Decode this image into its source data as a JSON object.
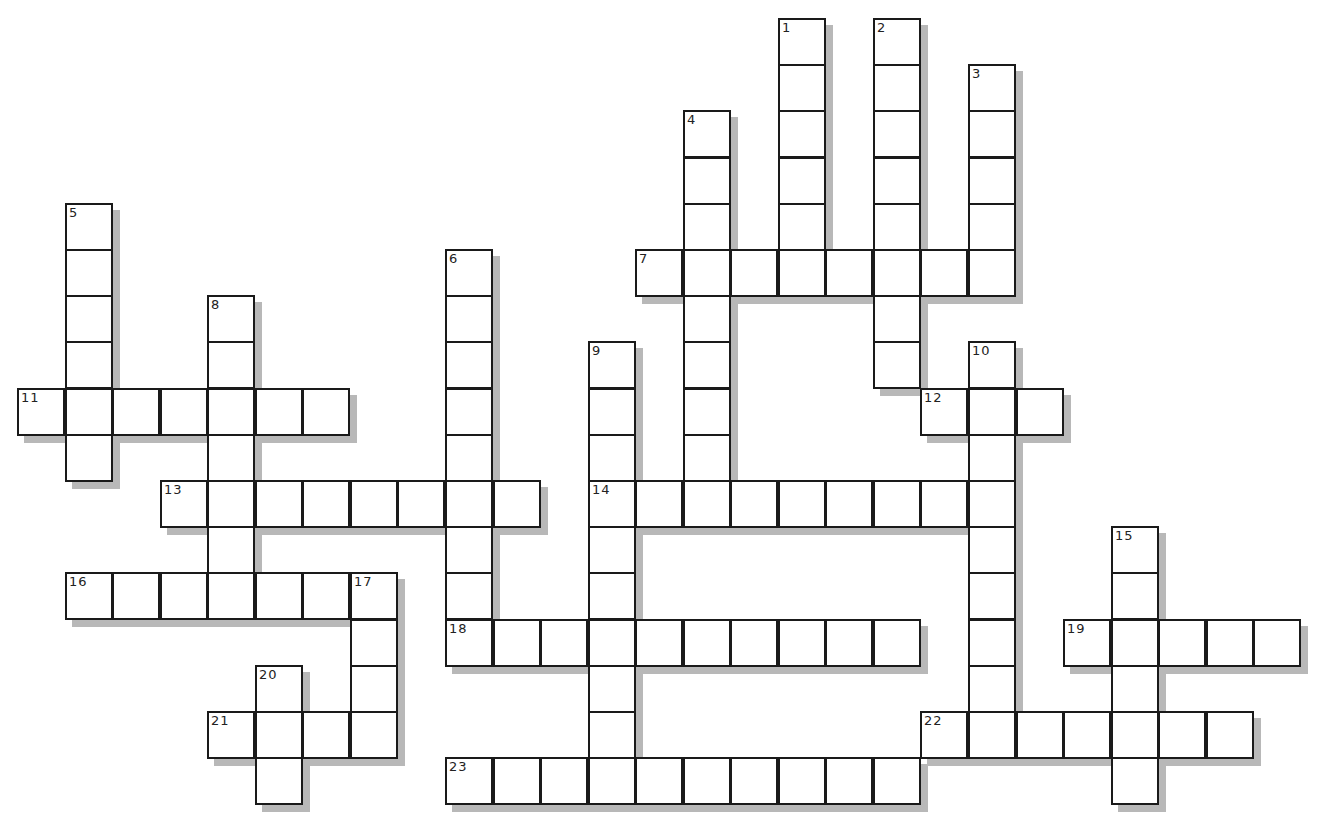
{
  "puzzle": {
    "type": "crossword",
    "words": [
      {
        "number": "1",
        "direction": "down",
        "row": 0,
        "col": 16,
        "length": 6
      },
      {
        "number": "2",
        "direction": "down",
        "row": 0,
        "col": 18,
        "length": 8
      },
      {
        "number": "3",
        "direction": "down",
        "row": 1,
        "col": 20,
        "length": 5
      },
      {
        "number": "4",
        "direction": "down",
        "row": 2,
        "col": 14,
        "length": 9
      },
      {
        "number": "5",
        "direction": "down",
        "row": 4,
        "col": 1,
        "length": 6
      },
      {
        "number": "6",
        "direction": "down",
        "row": 5,
        "col": 9,
        "length": 9
      },
      {
        "number": "7",
        "direction": "across",
        "row": 5,
        "col": 13,
        "length": 8
      },
      {
        "number": "8",
        "direction": "down",
        "row": 6,
        "col": 4,
        "length": 7
      },
      {
        "number": "9",
        "direction": "down",
        "row": 7,
        "col": 12,
        "length": 10
      },
      {
        "number": "10",
        "direction": "down",
        "row": 7,
        "col": 20,
        "length": 9
      },
      {
        "number": "11",
        "direction": "across",
        "row": 8,
        "col": 0,
        "length": 7
      },
      {
        "number": "12",
        "direction": "across",
        "row": 8,
        "col": 19,
        "length": 3
      },
      {
        "number": "13",
        "direction": "across",
        "row": 10,
        "col": 3,
        "length": 8
      },
      {
        "number": "14",
        "direction": "across",
        "row": 10,
        "col": 12,
        "length": 9
      },
      {
        "number": "15",
        "direction": "down",
        "row": 11,
        "col": 23,
        "length": 6
      },
      {
        "number": "16",
        "direction": "across",
        "row": 12,
        "col": 1,
        "length": 7
      },
      {
        "number": "17",
        "direction": "down",
        "row": 12,
        "col": 7,
        "length": 4
      },
      {
        "number": "18",
        "direction": "across",
        "row": 13,
        "col": 9,
        "length": 10
      },
      {
        "number": "19",
        "direction": "across",
        "row": 13,
        "col": 22,
        "length": 5
      },
      {
        "number": "20",
        "direction": "down",
        "row": 14,
        "col": 5,
        "length": 3
      },
      {
        "number": "21",
        "direction": "across",
        "row": 15,
        "col": 4,
        "length": 4
      },
      {
        "number": "22",
        "direction": "across",
        "row": 15,
        "col": 19,
        "length": 7
      },
      {
        "number": "23",
        "direction": "across",
        "row": 16,
        "col": 9,
        "length": 10
      }
    ],
    "colors": {
      "cell_fill": "#ffffff",
      "cell_border": "#1a1a1a",
      "shadow": "#b8b8b8"
    }
  }
}
